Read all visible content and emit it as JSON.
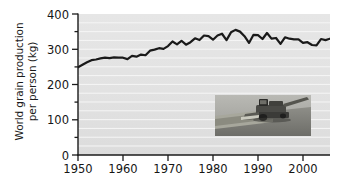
{
  "chart_data": {
    "type": "line",
    "title": "",
    "xlabel": "",
    "ylabel": "World grain production per person (kg)",
    "ylabel_line1": "World grain production",
    "ylabel_line2": "per person (kg)",
    "xlim": [
      1950,
      2006
    ],
    "ylim": [
      0,
      400
    ],
    "ytick_labels": [
      "0",
      "100",
      "200",
      "300",
      "400"
    ],
    "ytick_values": [
      0,
      100,
      200,
      300,
      400
    ],
    "yminor_step": 50,
    "xtick_labels": [
      "1950",
      "1960",
      "1970",
      "1980",
      "1990",
      "2000"
    ],
    "xtick_values": [
      1950,
      1960,
      1970,
      1980,
      1990,
      2000
    ],
    "grid": "horizontal-white-25kg",
    "legend": "none",
    "line_color": "#1a1a1a",
    "plot_background": "#e3e3e3",
    "gridline_color": "#f7f7f7",
    "series": [
      {
        "name": "World grain production per person",
        "units": "kg",
        "x": [
          1950,
          1951,
          1952,
          1953,
          1954,
          1955,
          1956,
          1957,
          1958,
          1959,
          1960,
          1961,
          1962,
          1963,
          1964,
          1965,
          1966,
          1967,
          1968,
          1969,
          1970,
          1971,
          1972,
          1973,
          1974,
          1975,
          1976,
          1977,
          1978,
          1979,
          1980,
          1981,
          1982,
          1983,
          1984,
          1985,
          1986,
          1987,
          1988,
          1989,
          1990,
          1991,
          1992,
          1993,
          1994,
          1995,
          1996,
          1997,
          1998,
          1999,
          2000,
          2001,
          2002,
          2003,
          2004,
          2005,
          2006
        ],
        "values": [
          249,
          256,
          263,
          269,
          271,
          274,
          276,
          275,
          277,
          276,
          276,
          272,
          281,
          279,
          285,
          283,
          296,
          299,
          303,
          301,
          309,
          322,
          314,
          324,
          313,
          320,
          331,
          326,
          339,
          337,
          327,
          339,
          344,
          326,
          348,
          355,
          350,
          337,
          318,
          341,
          340,
          329,
          346,
          330,
          332,
          315,
          334,
          330,
          328,
          328,
          318,
          320,
          312,
          311,
          329,
          326,
          330
        ]
      }
    ]
  },
  "inset_photo": {
    "caption": "combine-harvester-in-field",
    "alt": "Combine harvester harvesting a grain field"
  }
}
